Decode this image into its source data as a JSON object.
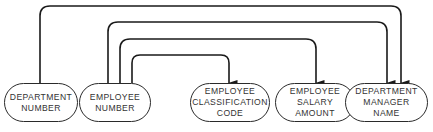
{
  "diagram": {
    "type": "functional-dependency",
    "stroke_color": "#1a1a1a",
    "nodes": [
      {
        "id": "dept_number",
        "lines": [
          "DEPARTMENT",
          "NUMBER"
        ]
      },
      {
        "id": "emp_number",
        "lines": [
          "EMPLOYEE",
          "NUMBER"
        ]
      },
      {
        "id": "emp_class_code",
        "lines": [
          "EMPLOYEE",
          "CLASSIFICATION",
          "CODE"
        ]
      },
      {
        "id": "emp_salary",
        "lines": [
          "EMPLOYEE",
          "SALARY",
          "AMOUNT"
        ]
      },
      {
        "id": "dept_mgr_name",
        "lines": [
          "DEPARTMENT",
          "MANAGER",
          "NAME"
        ]
      }
    ],
    "edges": [
      {
        "from": "DEPARTMENT NUMBER",
        "to": "DEPARTMENT MANAGER NAME"
      },
      {
        "from": "EMPLOYEE NUMBER",
        "to": "DEPARTMENT MANAGER NAME"
      },
      {
        "from": "EMPLOYEE NUMBER",
        "to": "EMPLOYEE SALARY AMOUNT"
      },
      {
        "from": "EMPLOYEE NUMBER",
        "to": "EMPLOYEE CLASSIFICATION CODE"
      }
    ]
  }
}
